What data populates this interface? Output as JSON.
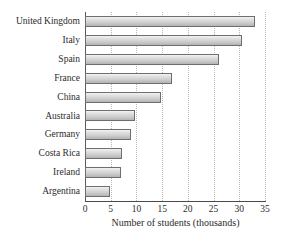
{
  "chart_data": {
    "type": "bar",
    "orientation": "horizontal",
    "title": "",
    "xlabel": "Number of students (thousands)",
    "ylabel": "",
    "categories": [
      "United Kingdom",
      "Italy",
      "Spain",
      "France",
      "China",
      "Australia",
      "Germany",
      "Costa Rica",
      "Ireland",
      "Argentina"
    ],
    "values": [
      33.0,
      30.5,
      26.0,
      17.0,
      14.7,
      9.8,
      9.0,
      7.2,
      7.0,
      4.8
    ],
    "xlim": [
      0,
      35
    ],
    "xticks": [
      0,
      5,
      10,
      15,
      20,
      25,
      30,
      35
    ],
    "xticklabels": [
      "0",
      "5",
      "10",
      "15",
      "20",
      "25",
      "30",
      "35"
    ],
    "grid": "vertical-dotted",
    "legend": null,
    "bar_fill": "#d8d8d8",
    "bar_edge": "#6e6e6e",
    "gridline_color": "#b9b9b9",
    "axis_color": "#4a4a4a",
    "text_color": "#2b2b2b"
  },
  "clipped_title_fragment": ""
}
